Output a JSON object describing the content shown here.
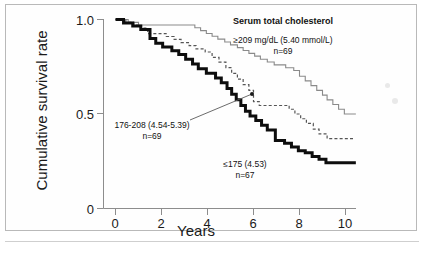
{
  "figure": {
    "background_color": "#ffffff",
    "frame_color": "#b9b9b9"
  },
  "chart_data": {
    "type": "line",
    "title": "",
    "xlabel": "Years",
    "ylabel": "Cumulative survival rate",
    "xlim": [
      0,
      10.6
    ],
    "ylim": [
      0,
      1.0
    ],
    "xticks": [
      0,
      2,
      4,
      6,
      8,
      10
    ],
    "xticklabels": [
      "0",
      "2",
      "4",
      "6",
      "8",
      "10"
    ],
    "yticks": [
      0,
      0.5,
      1.0
    ],
    "yticklabels": [
      "0",
      "0.5",
      "1.0"
    ],
    "grid": false,
    "legend_position": "upper-right-annotations",
    "plot_kind": "kaplan-meier survival curves",
    "series": [
      {
        "name": "≥209 mg/dL (5.40 mmol/L)",
        "group_label": "≥209 mg/dL  (5.40 mmol/L)",
        "n": 69,
        "style": "thin-gray-solid",
        "color": "#8a8a8a",
        "line_width": 1.1,
        "final_value": 0.5,
        "points": [
          [
            0.0,
            1.0
          ],
          [
            0.55,
            1.0
          ],
          [
            0.55,
            0.985
          ],
          [
            1.0,
            0.985
          ],
          [
            1.0,
            0.971
          ],
          [
            3.45,
            0.971
          ],
          [
            3.45,
            0.956
          ],
          [
            3.7,
            0.956
          ],
          [
            3.7,
            0.941
          ],
          [
            3.95,
            0.941
          ],
          [
            3.95,
            0.926
          ],
          [
            4.2,
            0.926
          ],
          [
            4.2,
            0.911
          ],
          [
            4.45,
            0.911
          ],
          [
            4.45,
            0.896
          ],
          [
            4.75,
            0.896
          ],
          [
            4.75,
            0.881
          ],
          [
            5.0,
            0.881
          ],
          [
            5.0,
            0.866
          ],
          [
            5.3,
            0.866
          ],
          [
            5.3,
            0.851
          ],
          [
            5.55,
            0.851
          ],
          [
            5.55,
            0.836
          ],
          [
            5.8,
            0.836
          ],
          [
            5.8,
            0.821
          ],
          [
            6.05,
            0.821
          ],
          [
            6.05,
            0.806
          ],
          [
            6.3,
            0.806
          ],
          [
            6.3,
            0.79
          ],
          [
            6.6,
            0.79
          ],
          [
            6.6,
            0.775
          ],
          [
            6.9,
            0.775
          ],
          [
            6.9,
            0.76
          ],
          [
            7.4,
            0.76
          ],
          [
            7.4,
            0.745
          ],
          [
            7.75,
            0.745
          ],
          [
            7.75,
            0.73
          ],
          [
            8.0,
            0.73
          ],
          [
            8.0,
            0.7
          ],
          [
            8.25,
            0.7
          ],
          [
            8.25,
            0.675
          ],
          [
            8.5,
            0.675
          ],
          [
            8.5,
            0.65
          ],
          [
            8.75,
            0.65
          ],
          [
            8.75,
            0.625
          ],
          [
            9.0,
            0.625
          ],
          [
            9.0,
            0.6
          ],
          [
            9.2,
            0.6
          ],
          [
            9.2,
            0.575
          ],
          [
            9.45,
            0.575
          ],
          [
            9.45,
            0.55
          ],
          [
            9.7,
            0.55
          ],
          [
            9.7,
            0.525
          ],
          [
            9.95,
            0.525
          ],
          [
            9.95,
            0.5
          ],
          [
            10.45,
            0.5
          ]
        ]
      },
      {
        "name": "176-208 (4.54-5.39)",
        "group_label": "176-208 (4.54-5.39)",
        "n": 69,
        "style": "dashed",
        "color": "#555555",
        "line_width": 1.2,
        "final_value": 0.37,
        "points": [
          [
            0.0,
            1.0
          ],
          [
            0.45,
            1.0
          ],
          [
            0.45,
            0.985
          ],
          [
            0.8,
            0.985
          ],
          [
            0.8,
            0.97
          ],
          [
            1.1,
            0.97
          ],
          [
            1.1,
            0.955
          ],
          [
            1.4,
            0.955
          ],
          [
            1.4,
            0.925
          ],
          [
            2.2,
            0.925
          ],
          [
            2.2,
            0.91
          ],
          [
            2.55,
            0.91
          ],
          [
            2.55,
            0.895
          ],
          [
            2.85,
            0.895
          ],
          [
            2.85,
            0.878
          ],
          [
            3.2,
            0.878
          ],
          [
            3.2,
            0.862
          ],
          [
            3.5,
            0.862
          ],
          [
            3.5,
            0.845
          ],
          [
            3.9,
            0.845
          ],
          [
            3.9,
            0.828
          ],
          [
            4.2,
            0.828
          ],
          [
            4.2,
            0.8
          ],
          [
            4.5,
            0.8
          ],
          [
            4.5,
            0.775
          ],
          [
            4.8,
            0.775
          ],
          [
            4.8,
            0.745
          ],
          [
            5.05,
            0.745
          ],
          [
            5.05,
            0.715
          ],
          [
            5.3,
            0.715
          ],
          [
            5.3,
            0.685
          ],
          [
            5.55,
            0.685
          ],
          [
            5.55,
            0.655
          ],
          [
            5.8,
            0.655
          ],
          [
            5.8,
            0.625
          ],
          [
            6.0,
            0.625
          ],
          [
            6.0,
            0.565
          ],
          [
            6.25,
            0.565
          ],
          [
            6.25,
            0.545
          ],
          [
            7.55,
            0.545
          ],
          [
            7.55,
            0.525
          ],
          [
            7.8,
            0.525
          ],
          [
            7.8,
            0.5
          ],
          [
            8.05,
            0.5
          ],
          [
            8.05,
            0.475
          ],
          [
            8.3,
            0.475
          ],
          [
            8.3,
            0.45
          ],
          [
            8.6,
            0.45
          ],
          [
            8.6,
            0.42
          ],
          [
            8.85,
            0.42
          ],
          [
            8.85,
            0.395
          ],
          [
            9.2,
            0.395
          ],
          [
            9.2,
            0.37
          ],
          [
            10.4,
            0.37
          ]
        ]
      },
      {
        "name": "≤175 (4.53)",
        "group_label": "≤175 (4.53)",
        "n": 67,
        "style": "thick-black-solid",
        "color": "#0d0d0d",
        "line_width": 3.0,
        "final_value": 0.24,
        "points": [
          [
            0.0,
            1.0
          ],
          [
            0.35,
            1.0
          ],
          [
            0.35,
            0.982
          ],
          [
            0.75,
            0.982
          ],
          [
            0.75,
            0.965
          ],
          [
            1.1,
            0.965
          ],
          [
            1.1,
            0.947
          ],
          [
            1.5,
            0.947
          ],
          [
            1.5,
            0.9
          ],
          [
            1.75,
            0.9
          ],
          [
            1.75,
            0.875
          ],
          [
            2.05,
            0.875
          ],
          [
            2.05,
            0.855
          ],
          [
            2.45,
            0.855
          ],
          [
            2.45,
            0.835
          ],
          [
            2.75,
            0.835
          ],
          [
            2.75,
            0.815
          ],
          [
            3.05,
            0.815
          ],
          [
            3.05,
            0.79
          ],
          [
            3.35,
            0.79
          ],
          [
            3.35,
            0.765
          ],
          [
            3.6,
            0.765
          ],
          [
            3.6,
            0.74
          ],
          [
            3.95,
            0.74
          ],
          [
            3.95,
            0.715
          ],
          [
            4.35,
            0.715
          ],
          [
            4.35,
            0.69
          ],
          [
            4.6,
            0.69
          ],
          [
            4.6,
            0.665
          ],
          [
            4.85,
            0.665
          ],
          [
            4.85,
            0.635
          ],
          [
            5.05,
            0.635
          ],
          [
            5.05,
            0.605
          ],
          [
            5.25,
            0.605
          ],
          [
            5.25,
            0.575
          ],
          [
            5.45,
            0.575
          ],
          [
            5.45,
            0.545
          ],
          [
            5.65,
            0.545
          ],
          [
            5.65,
            0.515
          ],
          [
            5.85,
            0.515
          ],
          [
            5.85,
            0.49
          ],
          [
            6.1,
            0.49
          ],
          [
            6.1,
            0.465
          ],
          [
            6.35,
            0.465
          ],
          [
            6.35,
            0.44
          ],
          [
            6.6,
            0.44
          ],
          [
            6.6,
            0.415
          ],
          [
            6.95,
            0.415
          ],
          [
            6.95,
            0.36
          ],
          [
            7.35,
            0.36
          ],
          [
            7.35,
            0.345
          ],
          [
            7.65,
            0.345
          ],
          [
            7.65,
            0.325
          ],
          [
            7.95,
            0.325
          ],
          [
            7.95,
            0.305
          ],
          [
            8.25,
            0.305
          ],
          [
            8.25,
            0.295
          ],
          [
            8.55,
            0.295
          ],
          [
            8.55,
            0.275
          ],
          [
            8.85,
            0.275
          ],
          [
            8.85,
            0.26
          ],
          [
            9.15,
            0.26
          ],
          [
            9.15,
            0.242
          ],
          [
            10.45,
            0.242
          ]
        ]
      }
    ],
    "annotations": [
      {
        "id": "legend-title",
        "text": "Serum total cholesterol",
        "bold": true,
        "x": 283,
        "y": 15
      },
      {
        "id": "high-group",
        "line1": "≥209 mg/dL  (5.40 mmol/L)",
        "line2": "n=69",
        "x": 283,
        "y": 37
      },
      {
        "id": "mid-group",
        "line1": "176-208 (4.54-5.39)",
        "line2": "n=69",
        "x": 152,
        "y": 122
      },
      {
        "id": "low-group",
        "line1": "≤175 (4.53)",
        "line2": "n=67",
        "x": 245,
        "y": 161
      }
    ],
    "leader_line": {
      "from_x": 190,
      "from_y": 120,
      "to_x": 252,
      "to_y": 94,
      "marker": "dot"
    }
  }
}
